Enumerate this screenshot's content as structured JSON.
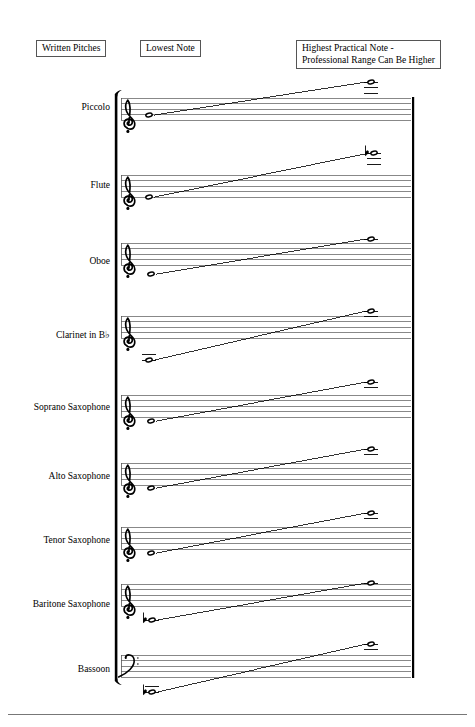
{
  "document": {
    "title": "Woodwind Written Pitch Ranges"
  },
  "headers": {
    "written_pitches": "Written Pitches",
    "lowest_note": "Lowest Note",
    "highest_note": "Highest Practical Note -\nProfessional Range Can Be Higher"
  },
  "colors": {
    "ink": "#000000",
    "staff_line": "#555555",
    "box_border": "#555555",
    "page_background": "#ffffff"
  },
  "staff_geometry": {
    "staff_left": 121,
    "staff_right": 411,
    "line_gap": 5.5,
    "bracket_x": 117,
    "right_barline_x": 412,
    "low_note_x": 149,
    "high_note_x": 371
  },
  "systems": [
    {
      "name": "piccolo",
      "label": "Piccolo",
      "clef": "treble",
      "clef_glyph": "G-clef",
      "staff_top": 98,
      "label_y": 108,
      "low_note": {
        "x": 149,
        "y": 115,
        "accidental": "",
        "ledger_lines": 0,
        "ledger_side": "none"
      },
      "high_note": {
        "x": 371,
        "y": 82,
        "accidental": "",
        "ledger_lines": 3,
        "ledger_side": "above"
      }
    },
    {
      "name": "flute",
      "label": "Flute",
      "clef": "treble",
      "clef_glyph": "G-clef",
      "staff_top": 175,
      "label_y": 186,
      "low_note": {
        "x": 149,
        "y": 197,
        "accidental": "",
        "ledger_lines": 0,
        "ledger_side": "none"
      },
      "high_note": {
        "x": 374,
        "y": 153,
        "accidental": "flat",
        "ledger_lines": 3,
        "ledger_side": "above"
      }
    },
    {
      "name": "oboe",
      "label": "Oboe",
      "clef": "treble",
      "clef_glyph": "G-clef",
      "staff_top": 243,
      "label_y": 262,
      "low_note": {
        "x": 151,
        "y": 274,
        "accidental": "",
        "ledger_lines": 0,
        "ledger_side": "none"
      },
      "high_note": {
        "x": 371,
        "y": 239,
        "accidental": "",
        "ledger_lines": 1,
        "ledger_side": "above"
      }
    },
    {
      "name": "clarinet-in-b-flat",
      "label": "Clarinet in B♭",
      "clef": "treble",
      "clef_glyph": "G-clef",
      "staff_top": 316,
      "label_y": 336,
      "low_note": {
        "x": 149,
        "y": 360,
        "accidental": "",
        "ledger_lines": 2,
        "ledger_side": "below"
      },
      "high_note": {
        "x": 371,
        "y": 311,
        "accidental": "",
        "ledger_lines": 2,
        "ledger_side": "above"
      }
    },
    {
      "name": "soprano-saxophone",
      "label": "Soprano Saxophone",
      "clef": "treble",
      "clef_glyph": "G-clef",
      "staff_top": 395,
      "label_y": 408,
      "low_note": {
        "x": 151,
        "y": 421,
        "accidental": "",
        "ledger_lines": 0,
        "ledger_side": "none"
      },
      "high_note": {
        "x": 371,
        "y": 382,
        "accidental": "",
        "ledger_lines": 2,
        "ledger_side": "above"
      }
    },
    {
      "name": "alto-saxophone",
      "label": "Alto Saxophone",
      "clef": "treble",
      "clef_glyph": "G-clef",
      "staff_top": 463,
      "label_y": 477,
      "low_note": {
        "x": 151,
        "y": 488,
        "accidental": "",
        "ledger_lines": 0,
        "ledger_side": "none"
      },
      "high_note": {
        "x": 371,
        "y": 449,
        "accidental": "",
        "ledger_lines": 2,
        "ledger_side": "above"
      }
    },
    {
      "name": "tenor-saxophone",
      "label": "Tenor Saxophone",
      "clef": "treble",
      "clef_glyph": "G-clef",
      "staff_top": 527,
      "label_y": 541,
      "low_note": {
        "x": 151,
        "y": 553,
        "accidental": "",
        "ledger_lines": 0,
        "ledger_side": "none"
      },
      "high_note": {
        "x": 371,
        "y": 513,
        "accidental": "",
        "ledger_lines": 2,
        "ledger_side": "above"
      }
    },
    {
      "name": "baritone-saxophone",
      "label": "Baritone Saxophone",
      "clef": "treble",
      "clef_glyph": "G-clef",
      "staff_top": 584,
      "label_y": 605,
      "low_note": {
        "x": 152,
        "y": 620,
        "accidental": "flat",
        "ledger_lines": 1,
        "ledger_side": "below"
      },
      "high_note": {
        "x": 371,
        "y": 583,
        "accidental": "",
        "ledger_lines": 1,
        "ledger_side": "above"
      }
    },
    {
      "name": "bassoon",
      "label": "Bassoon",
      "clef": "bass",
      "clef_glyph": "F-clef",
      "staff_top": 655,
      "label_y": 670,
      "low_note": {
        "x": 152,
        "y": 692,
        "accidental": "flat",
        "ledger_lines": 2,
        "ledger_side": "below"
      },
      "high_note": {
        "x": 371,
        "y": 644,
        "accidental": "",
        "ledger_lines": 2,
        "ledger_side": "above"
      }
    }
  ]
}
